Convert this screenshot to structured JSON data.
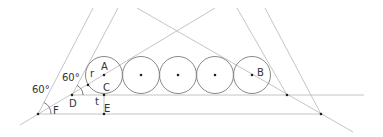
{
  "diagram": {
    "title": "",
    "labels": {
      "A": "A",
      "B": "B",
      "C": "C",
      "D": "D",
      "E": "E",
      "F": "F",
      "r": "r",
      "t": "t",
      "angle_upper": "60°",
      "angle_lower": "60°"
    },
    "circles": {
      "count": 5,
      "centers_x": [
        104,
        141,
        178,
        215,
        252
      ],
      "center_y": 75,
      "radius": 18.5
    },
    "colors": {
      "line": "#aaaaaa",
      "circle": "#777777",
      "point": "#222222",
      "text": "#333333"
    }
  }
}
